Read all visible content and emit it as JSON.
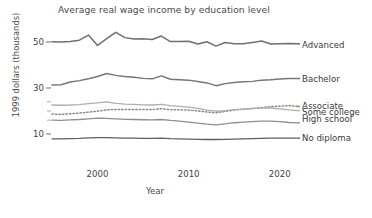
{
  "chart_data": {
    "type": "line",
    "title": "Average real wage income by education level",
    "xlabel": "Year",
    "ylabel": "1999 dollars (thousands)",
    "xlim": [
      1995,
      2022
    ],
    "ylim": [
      5,
      56
    ],
    "xticks": [
      2000,
      2010,
      2020
    ],
    "xtick_labels": [
      "2000",
      "2010",
      "2020"
    ],
    "yticks": [
      10,
      30,
      50
    ],
    "ytick_labels": [
      "10",
      "30",
      "50"
    ],
    "grid": false,
    "legend_position": "right-inline",
    "x": [
      1995,
      1996,
      1997,
      1998,
      1999,
      2000,
      2001,
      2002,
      2003,
      2004,
      2005,
      2006,
      2007,
      2008,
      2009,
      2010,
      2011,
      2012,
      2013,
      2014,
      2015,
      2016,
      2017,
      2018,
      2019,
      2020,
      2021,
      2022
    ],
    "series": [
      {
        "name": "Advanced",
        "style": "solid",
        "color": "#6f6f6f",
        "width": 1.5,
        "label_y": 48.6,
        "values": [
          50.1,
          50.0,
          50.2,
          50.8,
          53.0,
          48.5,
          51.5,
          54.2,
          51.9,
          51.3,
          51.4,
          51.1,
          52.6,
          50.2,
          50.2,
          50.3,
          49.1,
          50.1,
          48.2,
          49.8,
          49.2,
          49.2,
          49.8,
          50.4,
          49.1,
          49.2,
          49.3,
          49.2
        ]
      },
      {
        "name": "Bachelor",
        "style": "solid",
        "color": "#757575",
        "width": 1.4,
        "label_y": 33.6,
        "values": [
          31.3,
          31.4,
          32.6,
          33.2,
          34.0,
          35.0,
          36.3,
          35.5,
          35.0,
          34.7,
          34.2,
          34.0,
          35.3,
          33.8,
          33.6,
          33.4,
          32.8,
          32.2,
          31.0,
          31.9,
          32.4,
          32.7,
          32.9,
          33.4,
          33.6,
          33.9,
          34.1,
          34.1
        ]
      },
      {
        "name": "Associate",
        "style": "dotted",
        "color": "#8a8a8a",
        "width": 1.5,
        "label_y": 22.1,
        "values": [
          18.7,
          18.5,
          18.8,
          19.1,
          19.5,
          19.9,
          20.5,
          20.7,
          20.6,
          20.6,
          20.6,
          20.6,
          21.0,
          20.6,
          20.5,
          20.4,
          20.0,
          19.6,
          19.2,
          19.8,
          20.4,
          20.8,
          21.1,
          21.5,
          21.9,
          22.1,
          22.3,
          22.0
        ]
      },
      {
        "name": "Some college",
        "style": "solid",
        "color": "#aeaeae",
        "width": 1.3,
        "label_y": 19.3,
        "values": [
          22.6,
          22.5,
          22.6,
          22.8,
          23.2,
          23.5,
          24.0,
          23.3,
          23.0,
          22.9,
          22.7,
          22.6,
          22.9,
          22.3,
          22.0,
          21.7,
          21.1,
          20.4,
          19.9,
          20.2,
          20.6,
          20.8,
          21.0,
          21.4,
          21.3,
          20.9,
          20.5,
          20.2
        ]
      },
      {
        "name": "High school",
        "style": "solid",
        "color": "#8e8e8e",
        "width": 1.3,
        "label_y": 16.2,
        "values": [
          16.0,
          15.9,
          16.1,
          16.3,
          16.6,
          16.9,
          16.8,
          16.6,
          16.4,
          16.3,
          16.2,
          16.1,
          16.3,
          15.9,
          15.6,
          15.2,
          14.7,
          14.3,
          14.0,
          14.4,
          14.9,
          15.2,
          15.4,
          15.6,
          15.6,
          15.4,
          15.0,
          14.8
        ]
      },
      {
        "name": "No diploma",
        "style": "solid",
        "color": "#5f5f5f",
        "width": 1.3,
        "label_y": 8.1,
        "values": [
          7.9,
          7.9,
          8.0,
          8.1,
          8.3,
          8.4,
          8.4,
          8.3,
          8.2,
          8.2,
          8.1,
          8.1,
          8.2,
          8.0,
          7.9,
          7.8,
          7.7,
          7.6,
          7.6,
          7.7,
          7.8,
          7.9,
          8.0,
          8.1,
          8.2,
          8.2,
          8.2,
          8.2
        ]
      }
    ]
  }
}
